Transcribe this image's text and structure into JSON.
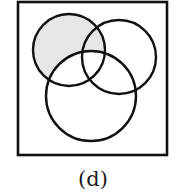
{
  "diagram": {
    "type": "venn",
    "caption": "(d)",
    "frame": {
      "x": 18,
      "y": 2,
      "width": 149,
      "height": 153
    },
    "sets": [
      {
        "id": "A",
        "position": "top-left",
        "cx": 69,
        "cy": 50,
        "r": 36
      },
      {
        "id": "B",
        "position": "top-right",
        "cx": 119,
        "cy": 57,
        "r": 37
      },
      {
        "id": "C",
        "position": "bottom",
        "cx": 91,
        "cy": 96,
        "r": 45
      }
    ],
    "shaded_region": "A minus C",
    "colors": {
      "stroke": "#111111",
      "shade": "#e6e6e6",
      "background": "#ffffff"
    }
  }
}
